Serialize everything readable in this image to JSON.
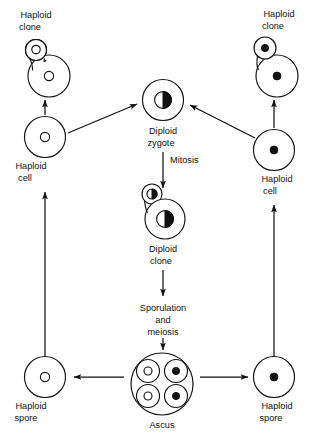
{
  "diagram": {
    "background_color": "#ffffff",
    "line_color": "#111111",
    "nucleus_filled_color": "#111111",
    "nucleus_open_color": "#ffffff"
  },
  "labels": {
    "haploid_clone_left_line1": "Haploid",
    "haploid_clone_left_line2": "clone",
    "haploid_clone_right_line1": "Haploid",
    "haploid_clone_right_line2": "clone",
    "haploid_cell_left_line1": "Haploid",
    "haploid_cell_left_line2": "cell",
    "haploid_cell_right_line1": "Haploid",
    "haploid_cell_right_line2": "cell",
    "diploid_zygote_line1": "Diploid",
    "diploid_zygote_line2": "zygote",
    "mitosis": "Mitosis",
    "diploid_clone_line1": "Diploid",
    "diploid_clone_line2": "clone",
    "sporulation_line1": "Sporulation",
    "sporulation_line2": "and",
    "sporulation_line3": "meiosis",
    "ascus": "Ascus",
    "haploid_spore_left_line1": "Haploid",
    "haploid_spore_left_line2": "spore",
    "haploid_spore_right_line1": "Haploid",
    "haploid_spore_right_line2": "spore"
  },
  "nodes": [
    {
      "id": "haploid-clone-left",
      "type": "budding-cell",
      "nucleus": "open",
      "label": "Haploid clone",
      "cx": 47,
      "cy": 70
    },
    {
      "id": "haploid-cell-left",
      "type": "single-cell",
      "nucleus": "open",
      "label": "Haploid cell",
      "cx": 45,
      "cy": 130
    },
    {
      "id": "haploid-spore-left",
      "type": "single-cell",
      "nucleus": "open",
      "label": "Haploid spore",
      "cx": 45,
      "cy": 378
    },
    {
      "id": "haploid-clone-right",
      "type": "budding-cell",
      "nucleus": "solid",
      "label": "Haploid clone",
      "cx": 275,
      "cy": 68
    },
    {
      "id": "haploid-cell-right",
      "type": "single-cell",
      "nucleus": "solid",
      "label": "Haploid cell",
      "cx": 274,
      "cy": 148
    },
    {
      "id": "haploid-spore-right",
      "type": "single-cell",
      "nucleus": "solid",
      "label": "Haploid spore",
      "cx": 274,
      "cy": 378
    },
    {
      "id": "diploid-zygote",
      "type": "single-cell",
      "nucleus": "half",
      "label": "Diploid zygote",
      "cx": 163,
      "cy": 100
    },
    {
      "id": "diploid-clone",
      "type": "budding-cell",
      "nucleus": "half",
      "label": "Diploid clone",
      "cx": 163,
      "cy": 212
    },
    {
      "id": "ascus",
      "type": "ascus",
      "spores": [
        "open",
        "solid",
        "open",
        "solid"
      ],
      "label": "Ascus",
      "cx": 162,
      "cy": 384
    }
  ],
  "arrows": [
    {
      "id": "arrow-haploid-cell-left-to-clone",
      "from": "haploid-cell-left",
      "to": "haploid-clone-left",
      "direction": "up"
    },
    {
      "id": "arrow-haploid-spore-left-to-cell",
      "from": "haploid-spore-left",
      "to": "haploid-cell-left",
      "direction": "up"
    },
    {
      "id": "arrow-haploid-cell-left-to-zygote",
      "from": "haploid-cell-left",
      "to": "diploid-zygote",
      "direction": "up-right"
    },
    {
      "id": "arrow-haploid-cell-right-to-clone",
      "from": "haploid-cell-right",
      "to": "haploid-clone-right",
      "direction": "up"
    },
    {
      "id": "arrow-haploid-spore-right-to-cell",
      "from": "haploid-spore-right",
      "to": "haploid-cell-right",
      "direction": "up"
    },
    {
      "id": "arrow-haploid-cell-right-to-zygote",
      "from": "haploid-cell-right",
      "to": "diploid-zygote",
      "direction": "up-left"
    },
    {
      "id": "arrow-zygote-to-diploid-clone",
      "from": "diploid-zygote",
      "to": "diploid-clone",
      "direction": "down",
      "label": "Mitosis"
    },
    {
      "id": "arrow-diploid-clone-to-ascus",
      "from": "diploid-clone",
      "to": "ascus",
      "direction": "down",
      "label": "Sporulation and meiosis"
    },
    {
      "id": "arrow-ascus-to-spore-left",
      "from": "ascus",
      "to": "haploid-spore-left",
      "direction": "left"
    },
    {
      "id": "arrow-ascus-to-spore-right",
      "from": "ascus",
      "to": "haploid-spore-right",
      "direction": "right"
    }
  ]
}
